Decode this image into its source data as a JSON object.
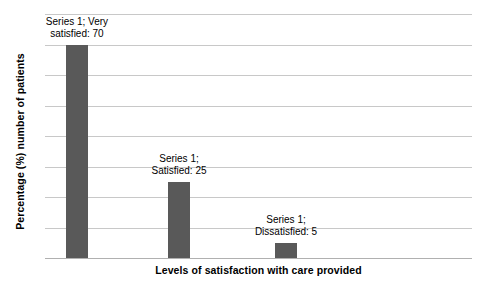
{
  "chart_data": {
    "type": "bar",
    "title": "",
    "xlabel": "Levels of satisfaction with care provided",
    "ylabel": "Percentage (%) number of patients",
    "categories": [
      "Very satisfied",
      "Satisfied",
      "Dissatisfied"
    ],
    "values": [
      70,
      25,
      5
    ],
    "series": [
      {
        "name": "Series 1",
        "values": [
          70,
          25,
          5
        ]
      }
    ],
    "data_labels": [
      {
        "line1": "Series 1; Very",
        "line2": "satisfied: 70",
        "category": "Very satisfied",
        "value": 70
      },
      {
        "line1": "Series 1;",
        "line2": "Satisfied: 25",
        "category": "Satisfied",
        "value": 25
      },
      {
        "line1": "Series 1;",
        "line2": "Dissatisfied: 5",
        "category": "Dissatisfied",
        "value": 5
      }
    ],
    "ylim": [
      0,
      80
    ],
    "ytick_values": [
      0,
      10,
      20,
      30,
      40,
      50,
      60,
      70,
      80
    ],
    "ytick_labels_visible": false,
    "xtick_labels_visible": false,
    "grid": true,
    "gridlines_count": 9,
    "legend": "none",
    "bar_color": "#595959",
    "gridline_color": "#c8c8c8",
    "axis_color": "#b0b0b0",
    "background_color": "#ffffff"
  }
}
